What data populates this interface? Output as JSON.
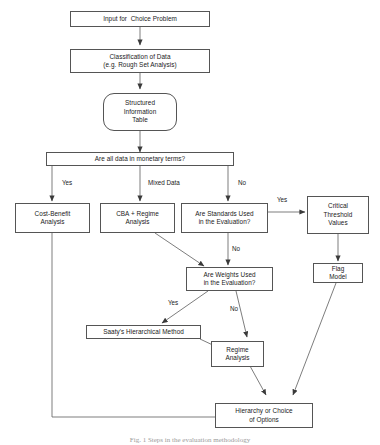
{
  "diagram": {
    "caption": "Fig. 1 Steps in the evaluation methodology",
    "stroke_color": "#555555",
    "text_color": "#1a1a1a",
    "background": "#ffffff",
    "nodes": [
      {
        "id": "input",
        "shape": "rect",
        "lines": [
          "Input for  Choice Problem"
        ]
      },
      {
        "id": "classify",
        "shape": "rect",
        "lines": [
          "Classification of Data",
          "(e.g. Rough Set Analysis)"
        ]
      },
      {
        "id": "structured",
        "shape": "rounded-rect",
        "lines": [
          "Structured",
          "Information",
          "Table"
        ]
      },
      {
        "id": "monetary",
        "shape": "rect",
        "lines": [
          "Are all data in monetary terms?"
        ]
      },
      {
        "id": "cba",
        "shape": "rect",
        "lines": [
          "Cost-Benefit",
          "Analysis"
        ]
      },
      {
        "id": "cbaregime",
        "shape": "rect",
        "lines": [
          "CBA + Regime",
          "Analysis"
        ]
      },
      {
        "id": "standards",
        "shape": "rect",
        "lines": [
          "Are Standards Used",
          "in the Evaluation?"
        ]
      },
      {
        "id": "critical",
        "shape": "rect",
        "lines": [
          "Critical",
          "Threshold",
          "Values"
        ]
      },
      {
        "id": "weights",
        "shape": "rect",
        "lines": [
          "Are Weights Used",
          "in the Evaluation?"
        ]
      },
      {
        "id": "flag",
        "shape": "rect",
        "lines": [
          "Flag",
          "Model"
        ]
      },
      {
        "id": "saaty",
        "shape": "rect",
        "lines": [
          "Saaty's Hierarchical Method"
        ]
      },
      {
        "id": "regime",
        "shape": "rect",
        "lines": [
          "Regime",
          "Analysis"
        ]
      },
      {
        "id": "hierarchy",
        "shape": "rect",
        "lines": [
          "Hierarchy or Choice",
          "of Options"
        ]
      }
    ],
    "edge_labels": [
      {
        "id": "yes-monetary",
        "text": "Yes"
      },
      {
        "id": "mixed-data",
        "text": "Mixed Data"
      },
      {
        "id": "no-monetary",
        "text": "No"
      },
      {
        "id": "yes-standards",
        "text": "Yes"
      },
      {
        "id": "no-standards",
        "text": "No"
      },
      {
        "id": "yes-weights",
        "text": "Yes"
      },
      {
        "id": "no-weights",
        "text": "No"
      }
    ]
  }
}
